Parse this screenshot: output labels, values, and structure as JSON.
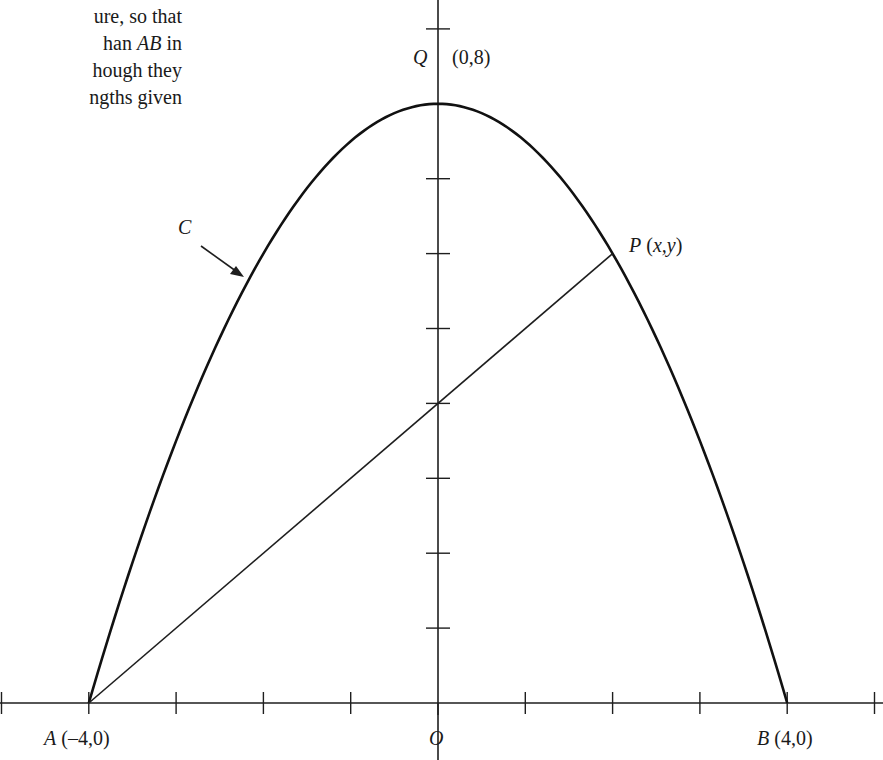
{
  "text_fragment": {
    "lines": [
      {
        "parts": [
          {
            "t": "ure, so that",
            "i": false
          }
        ]
      },
      {
        "parts": [
          {
            "t": "han ",
            "i": false
          },
          {
            "t": "AB",
            "i": true
          },
          {
            "t": " in",
            "i": false
          }
        ]
      },
      {
        "parts": [
          {
            "t": "hough they",
            "i": false
          }
        ]
      },
      {
        "parts": [
          {
            "t": "ngths given",
            "i": false
          }
        ]
      }
    ]
  },
  "labels": {
    "Q_name": "Q",
    "Q_coord": "(0,8)",
    "P_name": "P",
    "P_coord": "(x,y)",
    "C_name": "C",
    "A_name": "A",
    "A_coord": "(–4,0)",
    "B_name": "B",
    "B_coord": "(4,0)",
    "O_name": "O"
  },
  "chart_data": {
    "type": "line",
    "title": "",
    "curve": {
      "name": "C",
      "equation": "y = 8 - x^2/2",
      "from": [
        -4,
        0
      ],
      "to": [
        4,
        0
      ],
      "vertex": [
        0,
        8
      ]
    },
    "segment": {
      "from": [
        -4,
        0
      ],
      "to": [
        2,
        6
      ],
      "y_intercept": 4
    },
    "points": [
      {
        "name": "A",
        "x": -4,
        "y": 0,
        "label": "A (–4,0)"
      },
      {
        "name": "B",
        "x": 4,
        "y": 0,
        "label": "B (4,0)"
      },
      {
        "name": "Q",
        "x": 0,
        "y": 8,
        "label": "Q (0,8)"
      },
      {
        "name": "P",
        "x": 2,
        "y": 6,
        "label": "P (x,y)"
      },
      {
        "name": "O",
        "x": 0,
        "y": 0,
        "label": "O"
      }
    ],
    "x_ticks": [
      -5,
      -4,
      -3,
      -2,
      -1,
      0,
      1,
      2,
      3,
      4,
      5
    ],
    "y_ticks": [
      1,
      2,
      3,
      4,
      5,
      6,
      7,
      8,
      9
    ],
    "xlim": [
      -5,
      5
    ],
    "ylim": [
      0,
      9.4
    ],
    "xlabel": "",
    "ylabel": "",
    "grid": false
  }
}
